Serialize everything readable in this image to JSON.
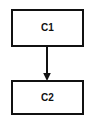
{
  "diagram": {
    "type": "flowchart",
    "width": 95,
    "height": 120,
    "background_color": "#ffffff",
    "stroke_color": "#111111",
    "fill_color": "#ffffff",
    "nodes": [
      {
        "id": "C1",
        "label": "C1",
        "shape": "rectangle",
        "x": 11,
        "y": 9,
        "width": 73,
        "height": 38
      },
      {
        "id": "C2",
        "label": "C2",
        "shape": "rectangle",
        "x": 11,
        "y": 80,
        "width": 73,
        "height": 35
      }
    ],
    "edges": [
      {
        "id": "C1-C2",
        "from": "C1",
        "to": "C2",
        "label": "",
        "style": "solid",
        "arrowhead": "filled-triangle",
        "direction": "down",
        "x": 47,
        "y_start": 47,
        "y_end": 80
      }
    ]
  }
}
